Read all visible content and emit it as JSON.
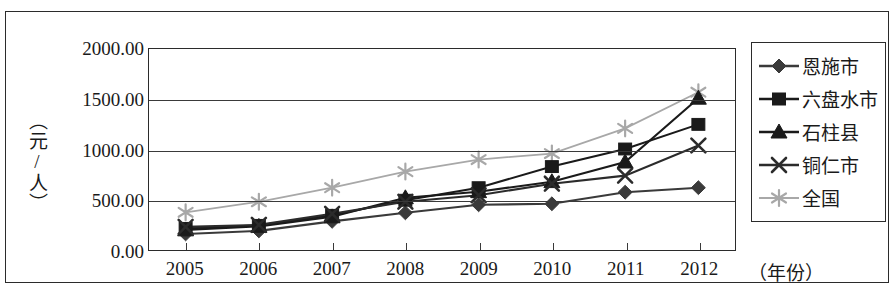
{
  "chart_data": {
    "type": "line",
    "title": "",
    "xlabel": "（年份）",
    "ylabel": "（元/人）",
    "x": [
      2005,
      2006,
      2007,
      2008,
      2009,
      2010,
      2011,
      2012
    ],
    "categories": [
      "2005",
      "2006",
      "2007",
      "2008",
      "2009",
      "2010",
      "2011",
      "2012"
    ],
    "xtick_labels": [
      "2005",
      "2006",
      "2007",
      "2008",
      "2009",
      "2010",
      "2011",
      "2012"
    ],
    "ytick_labels": [
      "0.00",
      "500.00",
      "1000.00",
      "1500.00",
      "2000.00"
    ],
    "ytick_values": [
      0,
      500,
      1000,
      1500,
      2000
    ],
    "ylim": [
      0,
      2000
    ],
    "grid": "horizontal",
    "legend_position": "right-outside",
    "series": [
      {
        "name": "恩施市",
        "marker": "diamond",
        "color": "#3a3a3a",
        "values": [
          160,
          190,
          285,
          370,
          450,
          460,
          575,
          620
        ]
      },
      {
        "name": "六盘水市",
        "marker": "square",
        "color": "#1a1a1a",
        "values": [
          215,
          245,
          345,
          495,
          620,
          830,
          1005,
          1250
        ]
      },
      {
        "name": "石柱县",
        "marker": "triangle",
        "color": "#1a1a1a",
        "values": [
          200,
          235,
          330,
          520,
          580,
          680,
          875,
          1510
        ]
      },
      {
        "name": "铜仁市",
        "marker": "x",
        "color": "#2b2b2b",
        "values": [
          230,
          250,
          360,
          480,
          545,
          660,
          740,
          1040
        ]
      },
      {
        "name": "全国",
        "marker": "asterisk",
        "color": "#a8a8a8",
        "values": [
          375,
          480,
          620,
          780,
          900,
          960,
          1210,
          1570
        ]
      }
    ]
  },
  "legend": {
    "items": [
      {
        "label": "恩施市"
      },
      {
        "label": "六盘水市"
      },
      {
        "label": "石柱县"
      },
      {
        "label": "铜仁市"
      },
      {
        "label": "全国"
      }
    ]
  }
}
